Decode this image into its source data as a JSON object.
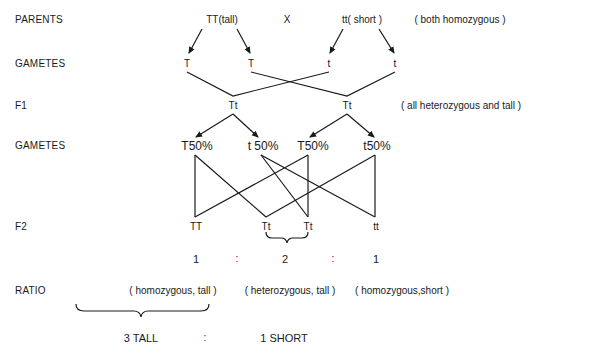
{
  "row_labels": {
    "parents": "PARENTS",
    "gametes1": "GAMETES",
    "f1": "F1",
    "gametes2": "GAMETES",
    "f2": "F2",
    "ratio": "RATIO"
  },
  "parents": {
    "tall": "TT(tall)",
    "cross": "X",
    "short": "tt( short )",
    "note": "( both homozygous )"
  },
  "gametes1": [
    "T",
    "T",
    "t",
    "t"
  ],
  "f1": {
    "offspring": [
      "Tt",
      "Tt"
    ],
    "note": "( all heterozygous and tall )"
  },
  "gametes2": [
    "T50%",
    "t 50%",
    "T50%",
    "t50%"
  ],
  "f2": [
    "TT",
    "Tt",
    "Tt",
    "tt"
  ],
  "ratio_numbers": {
    "n1": "1",
    "sep1": ":",
    "n2": "2",
    "sep2": ":",
    "n3": "1"
  },
  "ratio_descriptions": [
    "( homozygous, tall )",
    "( heterozygous, tall )",
    "( homozygous,short )"
  ],
  "phenotype": {
    "tall": "3 TALL",
    "sep": ":",
    "short": "1 SHORT"
  },
  "colors": {
    "ink": "#1a1a1a",
    "background": "#ffffff"
  }
}
